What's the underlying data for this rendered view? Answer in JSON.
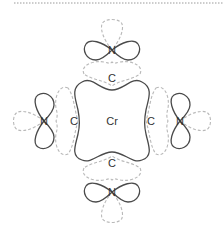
{
  "diagram": {
    "type": "orbital-bonding-diagram",
    "center_atom": {
      "label": "Cr"
    },
    "carbon_atoms": [
      {
        "position": "top",
        "label": "C"
      },
      {
        "position": "left",
        "label": "C"
      },
      {
        "position": "right",
        "label": "C"
      },
      {
        "position": "bottom",
        "label": "C"
      }
    ],
    "nitrogen_atoms": [
      {
        "position": "top",
        "label": "N"
      },
      {
        "position": "left",
        "label": "N"
      },
      {
        "position": "right",
        "label": "N"
      },
      {
        "position": "bottom",
        "label": "N"
      }
    ],
    "colors": {
      "solid_orbital": "#4a4a4a",
      "dashed_orbital": "#b9b9b9",
      "text": "#333333"
    }
  }
}
